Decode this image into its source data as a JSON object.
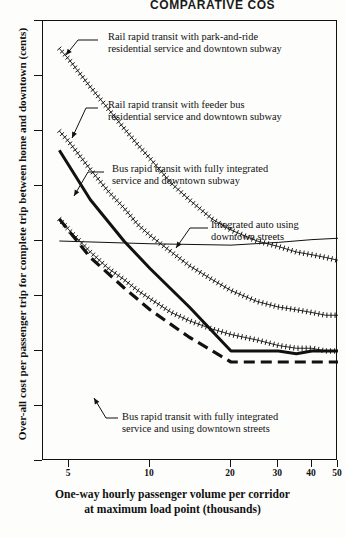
{
  "title": "COMPARATIVE COS",
  "axes": {
    "ylabel": "Over-all cost per passenger trip for complete trip between home and downtown (cents)",
    "xlabel_line1": "One-way hourly passenger volume per corridor",
    "xlabel_line2": "at maximum load point (thousands)",
    "yticks": [
      0,
      20,
      40,
      60,
      80,
      100,
      120,
      140,
      160
    ],
    "xticks": [
      5,
      10,
      20,
      30,
      40,
      50
    ]
  },
  "annotations": [
    "Rail rapid transit with park-and-ride\nresidential service and downtown subway",
    "Rail rapid transit with feeder bus\nresidential service and downtown subway",
    "Bus rapid transit with fully integrated\nservice and downtown subway",
    "Integrated auto using\ndowntown streets",
    "Bus rapid transit with fully integrated\nservice and using downtown streets"
  ],
  "chart_data": {
    "type": "line",
    "title": "COMPARATIVE COS",
    "xlabel": "One-way hourly passenger volume per corridor at maximum load point (thousands)",
    "ylabel": "Over-all cost per passenger trip for complete trip between home and downtown (cents)",
    "xlim": [
      4,
      50
    ],
    "ylim": [
      0,
      160
    ],
    "xscale": "log",
    "grid": false,
    "legend": "annotated-inline",
    "series": [
      {
        "name": "Rail rapid transit with park-and-ride residential service and downtown subway",
        "style": "hatched",
        "x": [
          4.6,
          5,
          6,
          7,
          8,
          9,
          10,
          12,
          14,
          17,
          20,
          25,
          30,
          35,
          40,
          45,
          50
        ],
        "y": [
          150,
          146,
          136,
          128,
          121,
          115,
          110,
          101,
          95,
          88,
          84,
          80,
          78,
          76,
          75,
          74,
          73
        ]
      },
      {
        "name": "Rail rapid transit with feeder bus residential service and downtown subway",
        "style": "hatched",
        "x": [
          4.6,
          5,
          6,
          7,
          8,
          9,
          10,
          12,
          14,
          17,
          20,
          25,
          30,
          35,
          40,
          45,
          50
        ],
        "y": [
          120,
          116,
          106,
          98,
          92,
          86,
          82,
          76,
          71,
          66,
          62,
          58,
          56,
          55,
          54,
          53,
          53
        ]
      },
      {
        "name": "Bus rapid transit with fully integrated service and downtown subway",
        "style": "hatched",
        "x": [
          4.6,
          5,
          6,
          7,
          8,
          9,
          10,
          12,
          14,
          17,
          20,
          25,
          30,
          35,
          40,
          45,
          50
        ],
        "y": [
          88,
          84,
          76,
          70,
          66,
          62,
          59,
          54,
          51,
          48,
          46,
          44,
          42,
          41,
          41,
          40,
          40
        ]
      },
      {
        "name": "Integrated auto using downtown streets",
        "style": "thin-solid",
        "x": [
          4.6,
          10,
          20,
          30,
          40,
          50
        ],
        "y": [
          80,
          79,
          78.5,
          79.5,
          80.5,
          81
        ]
      },
      {
        "name": "Bus rapid transit with fully integrated service and downtown subway (heavy)",
        "style": "heavy-solid",
        "x": [
          4.6,
          6,
          8,
          10,
          14,
          20,
          25,
          30,
          35,
          40,
          45,
          50
        ],
        "y": [
          113,
          95,
          80,
          70,
          56,
          40,
          40,
          40,
          39,
          40,
          40,
          40
        ]
      },
      {
        "name": "Bus rapid transit with fully integrated service and using downtown streets",
        "style": "heavy-dashed",
        "x": [
          4.6,
          6,
          8,
          10,
          14,
          20,
          25,
          30,
          35,
          40,
          45,
          50
        ],
        "y": [
          88,
          74,
          63,
          55,
          45,
          36,
          36,
          36,
          36,
          36,
          36,
          36
        ]
      }
    ]
  }
}
